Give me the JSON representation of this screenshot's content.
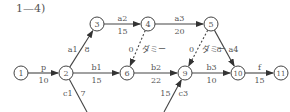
{
  "title": "1—4)",
  "nodes": [
    {
      "id": "1",
      "x": 21,
      "y": 73
    },
    {
      "id": "2",
      "x": 66,
      "y": 73
    },
    {
      "id": "3",
      "x": 97,
      "y": 24
    },
    {
      "id": "4",
      "x": 148,
      "y": 24
    },
    {
      "id": "5",
      "x": 211,
      "y": 24
    },
    {
      "id": "6",
      "x": 127,
      "y": 73
    },
    {
      "id": "9",
      "x": 185,
      "y": 73
    },
    {
      "id": "10",
      "x": 238,
      "y": 73
    },
    {
      "id": "11",
      "x": 281,
      "y": 73
    }
  ],
  "edges": [
    {
      "from": "1",
      "to": "2",
      "name": "p",
      "duration": "10",
      "dashed": false
    },
    {
      "from": "2",
      "to": "3",
      "name": "a1",
      "duration": "8",
      "dashed": false
    },
    {
      "from": "3",
      "to": "4",
      "name": "a2",
      "duration": "15",
      "dashed": false
    },
    {
      "from": "4",
      "to": "5",
      "name": "a3",
      "duration": "20",
      "dashed": false
    },
    {
      "from": "5",
      "to": "10",
      "name": "a4",
      "duration": "8",
      "dashed": false
    },
    {
      "from": "2",
      "to": "6",
      "name": "b1",
      "duration": "15",
      "dashed": false
    },
    {
      "from": "6",
      "to": "9",
      "name": "b2",
      "duration": "22",
      "dashed": false
    },
    {
      "from": "9",
      "to": "10",
      "name": "b3",
      "duration": "10",
      "dashed": false
    },
    {
      "from": "10",
      "to": "11",
      "name": "f",
      "duration": "15",
      "dashed": false
    },
    {
      "from": "4",
      "to": "6",
      "name": "ダミー",
      "duration": "0",
      "dashed": true
    },
    {
      "from": "5",
      "to": "9",
      "name": "ダミー",
      "duration": "0",
      "dashed": true
    }
  ],
  "open_edges": [
    {
      "name": "c1",
      "duration": "7",
      "x1": 66,
      "y1": 73,
      "x2": 87,
      "y2": 112,
      "arrow": false
    },
    {
      "name": "c3",
      "duration": "15",
      "x1": 164,
      "y1": 112,
      "x2": 185,
      "y2": 73,
      "arrow": true
    }
  ],
  "colors": {
    "line": "#444444",
    "text": "#555555",
    "node_fill": "#ffffff"
  }
}
